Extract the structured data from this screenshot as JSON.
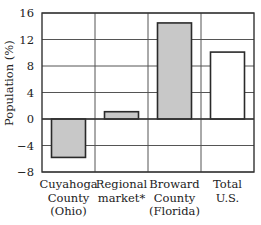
{
  "chart_data": {
    "type": "bar",
    "title": "",
    "xlabel": "",
    "ylabel": "Population (%)",
    "ylim": [
      -8,
      16
    ],
    "yticks": [
      16,
      12,
      8,
      4,
      0,
      -4,
      -8
    ],
    "grid": true,
    "legend": null,
    "categories": [
      "Cuyahoga County (Ohio)",
      "Regional market*",
      "Broward County (Florida)",
      "Total U.S."
    ],
    "category_lines": [
      [
        "Cuyahoga",
        "County",
        "(Ohio)"
      ],
      [
        "Regional",
        "market*"
      ],
      [
        "Broward",
        "County",
        "(Florida)"
      ],
      [
        "Total",
        "U.S."
      ]
    ],
    "values": [
      -5.8,
      1.1,
      14.5,
      10.1
    ],
    "bar_colors": [
      "#c8c8c8",
      "#c8c8c8",
      "#c8c8c8",
      "#ffffff"
    ]
  },
  "colors": {
    "axis": "#333333",
    "grid": "#555555",
    "bar_shaded": "#c8c8c8",
    "bar_plain": "#ffffff",
    "bar_edge": "#2a2a2a"
  }
}
